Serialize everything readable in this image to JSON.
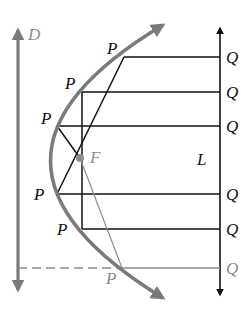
{
  "diagram": {
    "colors": {
      "parabola": "#7a7a7a",
      "directrix": "#7a7a7a",
      "line_L": "#111111",
      "rays": "#111111",
      "faded": "#8c8c8c",
      "focus": "#8c8c8c",
      "label": "#111111",
      "label_faded": "#8a8a8a"
    },
    "labels": {
      "directrix": "D",
      "focus": "F",
      "line": "L",
      "points_P": [
        "P",
        "P",
        "P",
        "P",
        "P",
        "P"
      ],
      "points_Q": [
        "Q",
        "Q",
        "Q",
        "Q",
        "Q",
        "Q"
      ]
    },
    "points": {
      "focus": {
        "x": 80,
        "y": 158
      },
      "P": [
        {
          "x": 124,
          "y": 57
        },
        {
          "x": 82,
          "y": 92
        },
        {
          "x": 57,
          "y": 126
        },
        {
          "x": 57,
          "y": 194
        },
        {
          "x": 82,
          "y": 229
        },
        {
          "x": 122,
          "y": 268
        }
      ],
      "Q_x": 220
    }
  }
}
